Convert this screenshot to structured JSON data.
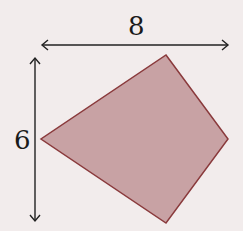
{
  "figure": {
    "width_label": "8",
    "height_label": "6",
    "shape": "kite quadrilateral",
    "vertices": [
      [
        166,
        55
      ],
      [
        228,
        139
      ],
      [
        166,
        223
      ],
      [
        41,
        139
      ]
    ],
    "colors": {
      "background": "#f2ecec",
      "fill": "#c8a2a4",
      "stroke": "#8a3a3c",
      "arrow": "#222222"
    }
  }
}
